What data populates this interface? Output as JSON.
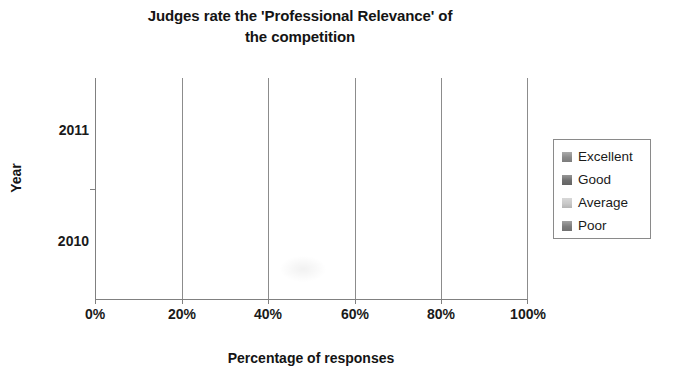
{
  "chart_data": {
    "type": "bar",
    "orientation": "horizontal",
    "stacked": true,
    "stack_mode": "percent",
    "title": "Judges rate the 'Professional Relevance' of the competition",
    "title_line1": "Judges rate the 'Professional Relevance' of",
    "title_line2": "the competition",
    "xlabel": "Percentage of responses",
    "ylabel": "Year",
    "categories": [
      "2011",
      "2010"
    ],
    "xlim": [
      0,
      100
    ],
    "xticks": [
      0,
      20,
      40,
      60,
      80,
      100
    ],
    "xticklabels": [
      "0%",
      "20%",
      "40%",
      "60%",
      "80%",
      "100%"
    ],
    "grid": true,
    "grid_axis": "x",
    "legend_position": "right",
    "series": [
      {
        "name": "Excellent",
        "color": "#8a8a8a",
        "values": [
          81,
          72
        ]
      },
      {
        "name": "Good",
        "color": "#6f6f6f",
        "values": [
          19,
          27
        ]
      },
      {
        "name": "Average",
        "color": "#c9c9c9",
        "values": [
          0,
          1
        ]
      },
      {
        "name": "Poor",
        "color": "#7d7d7d",
        "values": [
          0,
          0
        ]
      }
    ]
  },
  "legend": {
    "items": [
      {
        "label": "Excellent",
        "color": "#8a8a8a"
      },
      {
        "label": "Good",
        "color": "#6f6f6f"
      },
      {
        "label": "Average",
        "color": "#c9c9c9"
      },
      {
        "label": "Poor",
        "color": "#7d7d7d"
      }
    ]
  },
  "colors": {
    "axis": "#808080",
    "gridline": "#8c8c8c",
    "text": "#1a1a1a",
    "background": "#ffffff"
  }
}
